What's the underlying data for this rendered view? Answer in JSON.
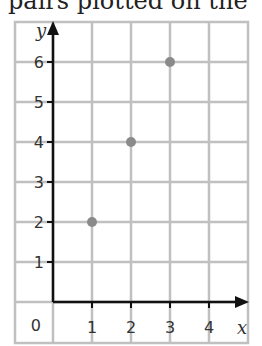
{
  "header": {
    "cropped_text": "pairs plotted on the"
  },
  "chart_data": {
    "type": "scatter",
    "title": "",
    "xlabel": "x",
    "ylabel": "y",
    "x_ticks": [
      1,
      2,
      3,
      4
    ],
    "y_ticks": [
      1,
      2,
      3,
      4,
      5,
      6
    ],
    "origin_label": "0",
    "xlim": [
      0,
      5
    ],
    "ylim": [
      0,
      7
    ],
    "grid": true,
    "points": [
      {
        "x": 1,
        "y": 2
      },
      {
        "x": 2,
        "y": 4
      },
      {
        "x": 3,
        "y": 6
      }
    ],
    "colors": {
      "grid": "#c0c0c0",
      "axis": "#111111",
      "point": "#8a8a8a"
    }
  }
}
